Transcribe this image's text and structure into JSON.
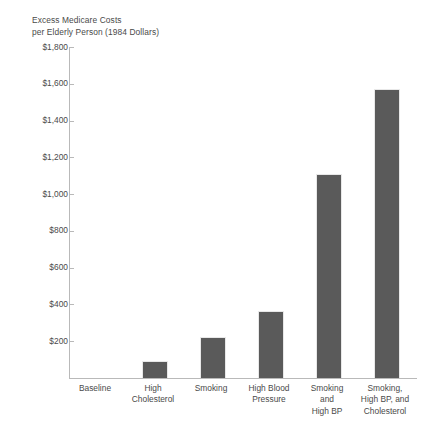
{
  "chart_data": {
    "type": "bar",
    "title": "Excess Medicare Costs\nper Elderly Person (1984 Dollars)",
    "xlabel": "",
    "ylabel": "",
    "categories": [
      "Baseline",
      "High\nCholesterol",
      "Smoking",
      "High Blood\nPressure",
      "Smoking\nand\nHigh BP",
      "Smoking,\nHigh BP, and\nCholesterol"
    ],
    "values": [
      0,
      90,
      225,
      365,
      1110,
      1570
    ],
    "ylim": [
      0,
      1800
    ],
    "ytick_values": [
      1800,
      1600,
      1400,
      1200,
      1000,
      800,
      600,
      400,
      200
    ],
    "ytick_labels": [
      "$1,800",
      "$1,600",
      "$1,400",
      "$1,200",
      "$1,000",
      "$800",
      "$600",
      "$400",
      "$200"
    ],
    "grid": false,
    "legend": null,
    "bar_color": "#5a5a5a",
    "axis_color": "#b9b9b9",
    "text_color": "#4a4a4a",
    "background_color": "#ffffff"
  }
}
